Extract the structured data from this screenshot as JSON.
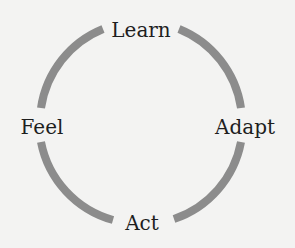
{
  "diagram": {
    "type": "cycle",
    "background": "#f3f3f2",
    "ring": {
      "color": "#8c8c8c",
      "stroke_width": 8,
      "center": [
        141,
        124
      ],
      "radius": 101
    },
    "nodes": [
      {
        "id": "learn",
        "label": "Learn",
        "position": "top",
        "x": 141,
        "y": 30
      },
      {
        "id": "adapt",
        "label": "Adapt",
        "position": "right",
        "x": 245,
        "y": 127
      },
      {
        "id": "act",
        "label": "Act",
        "position": "bottom",
        "x": 142,
        "y": 223
      },
      {
        "id": "feel",
        "label": "Feel",
        "position": "left",
        "x": 42,
        "y": 127
      }
    ],
    "sequence": [
      "Learn",
      "Adapt",
      "Act",
      "Feel"
    ]
  }
}
